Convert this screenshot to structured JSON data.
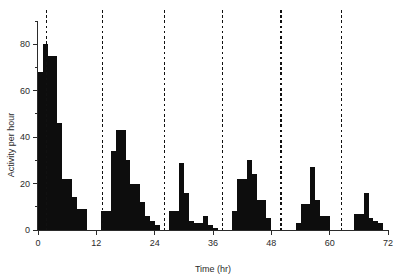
{
  "chart_data": {
    "type": "bar",
    "title": "",
    "subtitle": "",
    "xlabel": "Time (hr)",
    "ylabel": "Activity per hour",
    "xlim": [
      0,
      72
    ],
    "ylim": [
      0,
      90
    ],
    "xticks": [
      0,
      12,
      24,
      36,
      48,
      60,
      72
    ],
    "xtick_labels": [
      "0",
      "12",
      "24",
      "36",
      "48",
      "60",
      "72"
    ],
    "yticks": [
      0,
      20,
      40,
      60,
      80
    ],
    "ytick_labels": [
      "0",
      "20",
      "40",
      "60",
      "80"
    ],
    "yminor_ticks": [
      10,
      30,
      50,
      70,
      90
    ],
    "grid": false,
    "legend": null,
    "bar_width_hours": 1,
    "series": [
      {
        "name": "Activity per hour",
        "color": "#0d0d0d",
        "x": [
          0,
          1,
          2,
          3,
          4,
          5,
          6,
          7,
          8,
          9,
          10,
          11,
          12,
          13,
          14,
          15,
          16,
          17,
          18,
          19,
          20,
          21,
          22,
          23,
          24,
          25,
          26,
          27,
          28,
          29,
          30,
          31,
          32,
          33,
          34,
          35,
          36,
          37,
          38,
          39,
          40,
          41,
          42,
          43,
          44,
          45,
          46,
          47,
          48,
          49,
          50,
          51,
          52,
          53,
          54,
          55,
          56,
          57,
          58,
          59,
          60,
          61,
          62,
          63,
          64,
          65,
          66,
          67,
          68,
          69,
          70,
          71
        ],
        "values": [
          68,
          80,
          75,
          75,
          46,
          22,
          22,
          14,
          9,
          9,
          0,
          0,
          0,
          8,
          8,
          34,
          43,
          43,
          30,
          20,
          20,
          12,
          6,
          4,
          2,
          0,
          0,
          8,
          8,
          29,
          16,
          4,
          3,
          3,
          6,
          2,
          1,
          0,
          0,
          0,
          8,
          22,
          22,
          30,
          24,
          13,
          13,
          5,
          0,
          0,
          0,
          0,
          0,
          3,
          11,
          11,
          27,
          13,
          6,
          6,
          0,
          0,
          0,
          0,
          0,
          7,
          7,
          16,
          5,
          4,
          3,
          0
        ]
      }
    ],
    "marker_lines": {
      "label": "light-onset markers",
      "style": "dashed",
      "color": "#111111",
      "x": [
        1.7,
        13.2,
        26.0,
        38.0,
        50.0,
        62.5
      ]
    }
  },
  "figure": {
    "background_color": "#ffffff",
    "axis_color": "#2b2b2b",
    "bar_color": "#0d0d0d"
  }
}
